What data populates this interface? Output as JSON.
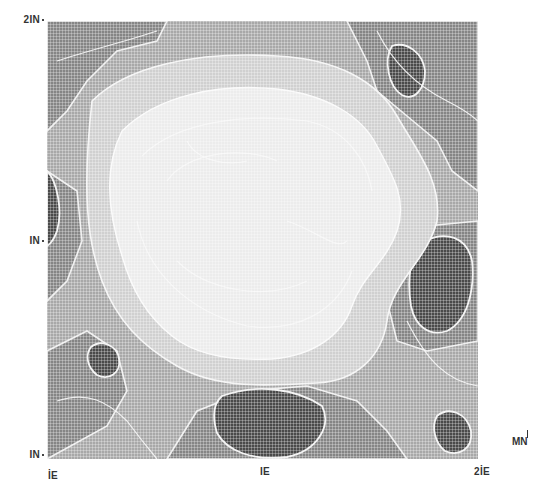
{
  "map": {
    "type": "grayscale contour density map",
    "y_axis": {
      "labels": [
        {
          "text": "2IN",
          "position": "top"
        },
        {
          "text": "IN",
          "position": "middle"
        },
        {
          "text": "IN",
          "position": "bottom"
        }
      ]
    },
    "x_axis": {
      "labels": [
        {
          "text": "İE",
          "position": "left"
        },
        {
          "text": "IE",
          "position": "center"
        },
        {
          "text": "2İE",
          "position": "right"
        }
      ]
    },
    "north_indicator": "MN",
    "shading_levels": [
      {
        "level": 1,
        "color": "#f0f0f0",
        "description": "lightest (center plateau)"
      },
      {
        "level": 2,
        "color": "#d6d6d6"
      },
      {
        "level": 3,
        "color": "#b4b4b4"
      },
      {
        "level": 4,
        "color": "#8c8c8c"
      },
      {
        "level": 5,
        "color": "#4a4a4a",
        "description": "darkest pockets"
      }
    ],
    "contour_line_color": "#f4f4f4"
  }
}
